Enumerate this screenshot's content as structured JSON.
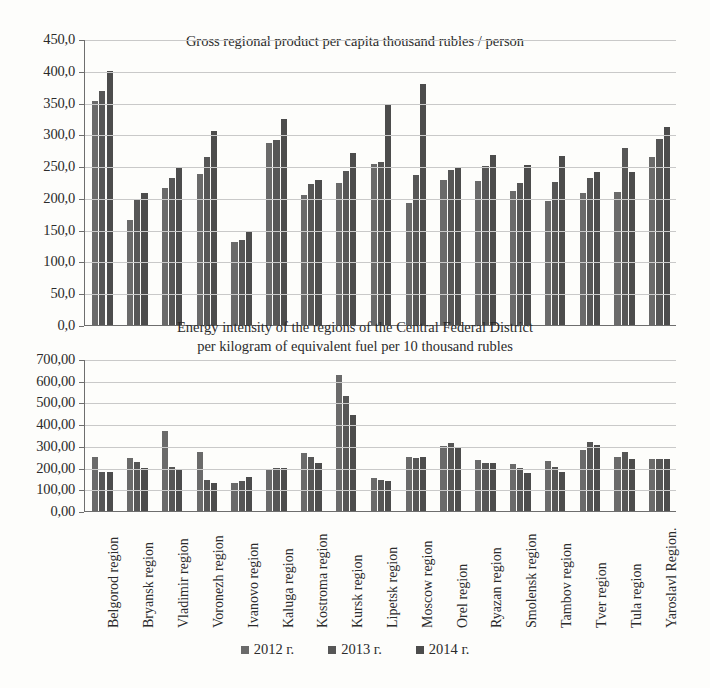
{
  "legend": {
    "position": "bottom",
    "entries": [
      {
        "label": "2012 г.",
        "color": "#6a6a6a"
      },
      {
        "label": "2013 г.",
        "color": "#565656"
      },
      {
        "label": "2014 г.",
        "color": "#4c4c4c"
      }
    ]
  },
  "categories": [
    "Belgorod region",
    "Bryansk region",
    "Vladimir region",
    "Voronezh region",
    "Ivanovo region",
    "Kaluga region",
    "Kostroma region",
    "Kursk region",
    "Lipetsk region",
    "Moscow region",
    "Orel region",
    "Ryazan region",
    "Smolensk region",
    "Tambov region",
    "Tver region",
    "Tula region",
    "Yaroslavl Region."
  ],
  "chart_data": [
    {
      "type": "bar",
      "title": "Gross regional product per capita thousand rubles / person",
      "xlabel": "",
      "ylabel": "",
      "ylim": [
        0,
        450
      ],
      "ytick_step": 50,
      "ytick_labels": [
        "0,0",
        "50,0",
        "100,0",
        "150,0",
        "200,0",
        "250,0",
        "300,0",
        "350,0",
        "400,0",
        "450,0"
      ],
      "grid": true,
      "legend_position": "bottom",
      "categories": [
        "Belgorod region",
        "Bryansk region",
        "Vladimir region",
        "Voronezh region",
        "Ivanovo region",
        "Kaluga region",
        "Kostroma region",
        "Kursk region",
        "Lipetsk region",
        "Moscow region",
        "Orel region",
        "Ryazan region",
        "Smolensk region",
        "Tambov region",
        "Tver region",
        "Tula region",
        "Yaroslavl Region."
      ],
      "series": [
        {
          "name": "2012 г.",
          "values": [
            353,
            165,
            216,
            238,
            130,
            286,
            204,
            223,
            254,
            192,
            228,
            226,
            211,
            195,
            208,
            210,
            265
          ]
        },
        {
          "name": "2013 г.",
          "values": [
            368,
            196,
            232,
            265,
            133,
            291,
            222,
            243,
            257,
            236,
            244,
            250,
            223,
            225,
            231,
            278,
            293
          ]
        },
        {
          "name": "2014 г.",
          "values": [
            400,
            207,
            248,
            306,
            148,
            324,
            228,
            271,
            348,
            380,
            248,
            268,
            252,
            266,
            240,
            240,
            312
          ]
        }
      ]
    },
    {
      "type": "bar",
      "title_line1": "Energy intensity of the regions of the Central Federal District",
      "title_line2": "per kilogram of equivalent fuel per 10 thousand rubles",
      "xlabel": "",
      "ylabel": "",
      "ylim": [
        0,
        700
      ],
      "ytick_step": 100,
      "ytick_labels": [
        "0,00",
        "100,00",
        "200,00",
        "300,00",
        "400,00",
        "500,00",
        "600,00",
        "700,00"
      ],
      "grid": true,
      "legend_position": "bottom",
      "categories": [
        "Belgorod region",
        "Bryansk region",
        "Vladimir region",
        "Voronezh region",
        "Ivanovo region",
        "Kaluga region",
        "Kostroma region",
        "Kursk region",
        "Lipetsk region",
        "Moscow region",
        "Orel region",
        "Ryazan region",
        "Smolensk region",
        "Tambov region",
        "Tver region",
        "Tula region",
        "Yaroslavl Region."
      ],
      "series": [
        {
          "name": "2012 г.",
          "values": [
            250,
            245,
            370,
            270,
            128,
            195,
            268,
            625,
            152,
            248,
            300,
            235,
            215,
            230,
            283,
            250,
            240
          ]
        },
        {
          "name": "2013 г.",
          "values": [
            180,
            225,
            205,
            145,
            138,
            200,
            250,
            530,
            145,
            245,
            312,
            222,
            200,
            205,
            318,
            272,
            238
          ]
        },
        {
          "name": "2014 г.",
          "values": [
            178,
            200,
            192,
            130,
            158,
            198,
            222,
            440,
            140,
            247,
            288,
            220,
            175,
            178,
            305,
            238,
            238
          ]
        }
      ]
    }
  ]
}
